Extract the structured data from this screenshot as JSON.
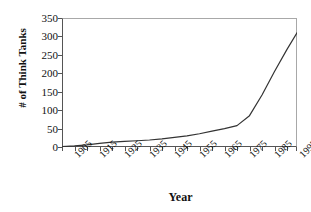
{
  "chart_data": {
    "type": "line",
    "title": "",
    "xlabel": "Year",
    "ylabel": "# of Think Tanks",
    "xlim": [
      1905,
      1999
    ],
    "ylim": [
      0,
      350
    ],
    "grid": false,
    "legend": false,
    "y_ticks": [
      350,
      300,
      250,
      200,
      150,
      100,
      50,
      0
    ],
    "x_tick_labels": [
      "1905",
      "1915",
      "1925",
      "1935",
      "1945",
      "1955",
      "1965",
      "1975",
      "1985",
      "1995"
    ],
    "x_tick_values": [
      1905,
      1915,
      1925,
      1935,
      1945,
      1955,
      1965,
      1975,
      1985,
      1995
    ],
    "x_minor_ticks": [
      1905,
      1910,
      1915,
      1920,
      1925,
      1930,
      1935,
      1940,
      1945,
      1950,
      1955,
      1960,
      1965,
      1970,
      1975,
      1980,
      1985,
      1990,
      1995,
      1999
    ],
    "series": [
      {
        "name": "# of Think Tanks",
        "color": "#333333",
        "x": [
          1905,
          1910,
          1915,
          1920,
          1925,
          1930,
          1935,
          1940,
          1945,
          1950,
          1955,
          1960,
          1965,
          1970,
          1975,
          1980,
          1985,
          1990,
          1995,
          1999
        ],
        "values": [
          1,
          3,
          6,
          10,
          13,
          15,
          17,
          19,
          22,
          26,
          30,
          36,
          43,
          50,
          58,
          85,
          141,
          205,
          265,
          310
        ]
      }
    ],
    "colors": {
      "line": "#333333",
      "axis": "#555555",
      "frame": "#a8a8a8",
      "text": "#111111",
      "background": "#ffffff"
    }
  }
}
